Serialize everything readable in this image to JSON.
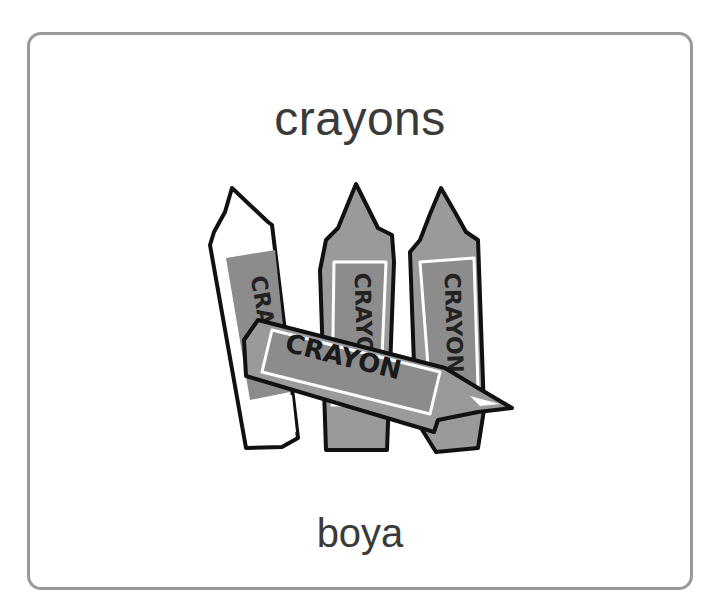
{
  "card": {
    "title": "crayons",
    "translation": "boya",
    "image": {
      "icon": "crayons-illustration",
      "crayon_label": "CRAYON"
    }
  },
  "colors": {
    "border": "#9a9a9a",
    "text": "#3a3a3a",
    "crayon_fill": "#8c8c8c",
    "crayon_tip": "#9a9a9a",
    "outline": "#111111"
  }
}
